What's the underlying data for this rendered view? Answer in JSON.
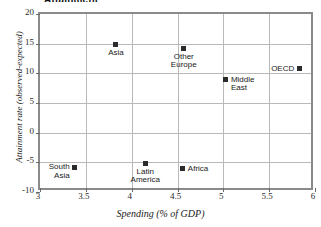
{
  "chart_data": {
    "type": "scatter",
    "title": "Attainment",
    "xlabel": "Spending (% of GDP)",
    "ylabel": "Attainment rate (observed-expected)",
    "xlim": [
      3,
      6
    ],
    "ylim": [
      -10,
      20
    ],
    "xticks": [
      "3",
      "3.5",
      "4",
      "4.5",
      "5",
      "5.5",
      "6"
    ],
    "xtick_values": [
      3,
      3.5,
      4,
      4.5,
      5,
      5.5,
      6
    ],
    "yticks": [
      "20",
      "15",
      "10",
      "5",
      "0",
      "-5",
      "-10"
    ],
    "ytick_values": [
      20,
      15,
      10,
      5,
      0,
      -5,
      -10
    ],
    "grid": true,
    "legend": "none",
    "marker_color": "#2b2b2b",
    "marker_shape": "square",
    "points": [
      {
        "label": "Asia",
        "x": 3.85,
        "y": 14.5,
        "label_pos": "below"
      },
      {
        "label": "Other\nEurope",
        "x": 4.59,
        "y": 13.8,
        "label_pos": "below"
      },
      {
        "label": "OECD",
        "x": 5.85,
        "y": 10.4,
        "label_pos": "left"
      },
      {
        "label": "Middle\nEast",
        "x": 5.05,
        "y": 8.6,
        "label_pos": "right"
      },
      {
        "label": "South\nAsia",
        "x": 3.4,
        "y": -6.2,
        "label_pos": "left"
      },
      {
        "label": "Latin\nAmerica",
        "x": 4.17,
        "y": -5.6,
        "label_pos": "below"
      },
      {
        "label": "Africa",
        "x": 4.58,
        "y": -6.4,
        "label_pos": "right"
      }
    ]
  }
}
